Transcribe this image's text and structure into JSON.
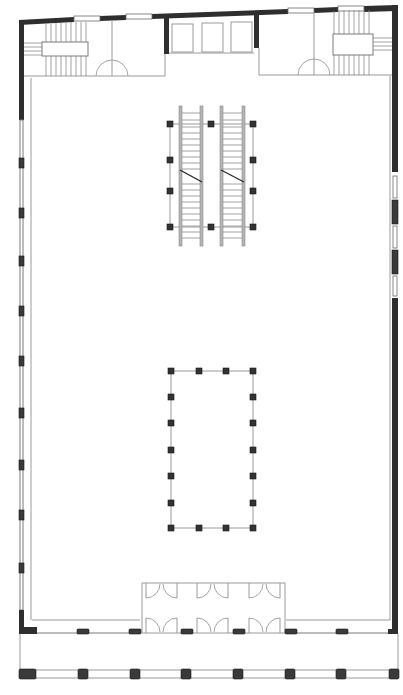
{
  "drawing": {
    "type": "architectural-floor-plan",
    "width": 403,
    "height": 695,
    "colors": {
      "wall": "#2e2e2e",
      "line": "#9a9a9a",
      "column": "#333333",
      "background": "#ffffff"
    }
  },
  "top_windows": [
    {
      "x": 75,
      "y": 16,
      "w": 24,
      "h": 5
    },
    {
      "x": 127,
      "y": 13,
      "w": 24,
      "h": 5
    },
    {
      "x": 289,
      "y": 8,
      "w": 24,
      "h": 5
    },
    {
      "x": 339,
      "y": 6,
      "w": 24,
      "h": 5
    }
  ],
  "left_pilasters_y": [
    158,
    210,
    260,
    310,
    358,
    410,
    460,
    512,
    565
  ],
  "right_windows_y": [
    178,
    228,
    280
  ],
  "atrium_columns": {
    "top": [
      [
        171,
        367
      ],
      [
        198,
        367
      ],
      [
        225,
        367
      ],
      [
        253,
        367
      ]
    ],
    "left": [
      [
        171,
        394
      ],
      [
        171,
        420
      ],
      [
        171,
        447
      ],
      [
        171,
        473
      ],
      [
        171,
        500
      ]
    ],
    "right": [
      [
        253,
        394
      ],
      [
        253,
        420
      ],
      [
        253,
        447
      ],
      [
        253,
        473
      ],
      [
        253,
        500
      ]
    ],
    "bottom": [
      [
        171,
        528
      ],
      [
        198,
        528
      ],
      [
        225,
        528
      ],
      [
        253,
        528
      ]
    ]
  },
  "escalator_columns": [
    [
      170,
      124
    ],
    [
      211,
      124
    ],
    [
      253,
      124
    ],
    [
      170,
      160
    ],
    [
      253,
      160
    ],
    [
      170,
      191
    ],
    [
      253,
      191
    ],
    [
      170,
      227
    ],
    [
      211,
      227
    ],
    [
      253,
      227
    ]
  ],
  "front_piers_y": 631,
  "front_piers_x": [
    28,
    84,
    135,
    187,
    238,
    290,
    341,
    393
  ],
  "arcade_columns_y": 673,
  "arcade_columns_x": [
    28,
    83,
    134,
    186,
    238,
    290,
    342,
    393
  ]
}
